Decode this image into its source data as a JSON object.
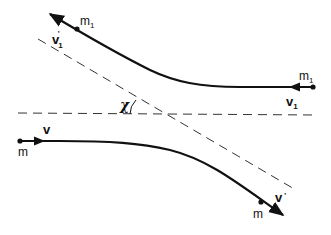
{
  "diagram": {
    "colors": {
      "stroke": "#111111",
      "background": "#ffffff"
    },
    "labels": {
      "m1_upper": "m",
      "m1_upper_sub": "1",
      "v1_prime": "v",
      "v1_prime_sub": "1",
      "v1_prime_prime": "'",
      "m1_right": "m",
      "m1_right_sub": "1",
      "v1": "v",
      "v1_sub": "1",
      "chi": "χ",
      "v": "v",
      "m_left": "m",
      "m_lower": "m",
      "v_prime": "v",
      "v_prime_prime": "'"
    },
    "elements": [
      "trajectory of particle m1 (incoming from right with velocity v1, outgoing up-left with velocity v1')",
      "trajectory of particle m (incoming from left with velocity v, outgoing down-right with velocity v')",
      "horizontal dashed asymptote",
      "diagonal dashed asymptote",
      "deflection angle χ between asymptotes"
    ]
  }
}
